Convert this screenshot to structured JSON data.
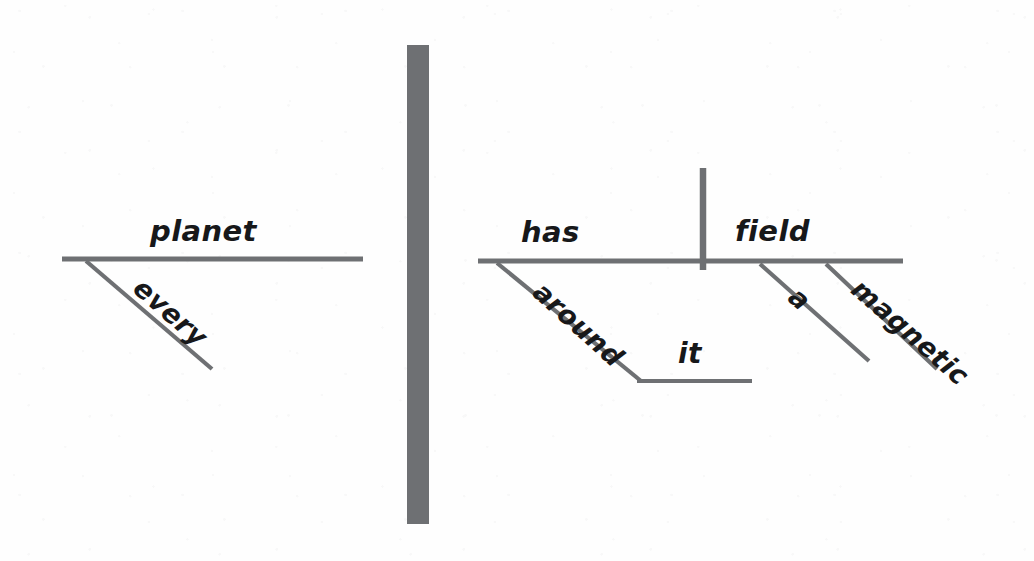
{
  "diagram": {
    "kind": "reed-kellogg-sentence-diagram",
    "sentence": "Every planet has a magnetic field around it.",
    "ink_color": "#6e7073",
    "text_color": "#17181a",
    "background_color": "#fefefe",
    "canvas": {
      "width": 1034,
      "height": 561
    },
    "words": {
      "subject": "planet",
      "subject_modifier": "every",
      "verb": "has",
      "direct_object": "field",
      "object_article": "a",
      "object_adjective": "magnetic",
      "preposition": "around",
      "preposition_object": "it"
    },
    "labels": [
      {
        "id": "planet",
        "text": "planet",
        "x": 150,
        "y": 214,
        "size": 29,
        "rotate": 0,
        "role": "subject"
      },
      {
        "id": "every",
        "text": "every",
        "x": 148,
        "y": 272,
        "size": 27,
        "rotate": 41,
        "role": "subject-modifier"
      },
      {
        "id": "has",
        "text": "has",
        "x": 521,
        "y": 215,
        "size": 29,
        "rotate": 0,
        "role": "verb"
      },
      {
        "id": "around",
        "text": "around",
        "x": 548,
        "y": 276,
        "size": 27,
        "rotate": 42,
        "role": "preposition"
      },
      {
        "id": "it",
        "text": "it",
        "x": 678,
        "y": 337,
        "size": 28,
        "rotate": 0,
        "role": "preposition-object"
      },
      {
        "id": "field",
        "text": "field",
        "x": 735,
        "y": 214,
        "size": 29,
        "rotate": 0,
        "role": "direct-object"
      },
      {
        "id": "a",
        "text": "a",
        "x": 803,
        "y": 281,
        "size": 27,
        "rotate": 41,
        "role": "object-article"
      },
      {
        "id": "magnetic",
        "text": "magnetic",
        "x": 866,
        "y": 273,
        "size": 27,
        "rotate": 41,
        "role": "object-adjective"
      }
    ],
    "strokes": [
      {
        "id": "left-baseline",
        "type": "line",
        "x1": 62,
        "y1": 259,
        "x2": 363,
        "y2": 259,
        "width": 5.2
      },
      {
        "id": "every-modifier-line",
        "type": "line",
        "x1": 86,
        "y1": 261,
        "x2": 212,
        "y2": 369,
        "width": 4.2
      },
      {
        "id": "center-divider-bar",
        "type": "rect",
        "x": 407,
        "y": 45,
        "w": 22,
        "h": 479
      },
      {
        "id": "right-baseline",
        "type": "line",
        "x1": 478,
        "y1": 261,
        "x2": 903,
        "y2": 261,
        "width": 5.2
      },
      {
        "id": "verb-object-divider",
        "type": "line",
        "x1": 703,
        "y1": 168,
        "x2": 703,
        "y2": 270,
        "width": 6.5
      },
      {
        "id": "around-prep-line",
        "type": "line",
        "x1": 497,
        "y1": 263,
        "x2": 641,
        "y2": 381,
        "width": 4.2
      },
      {
        "id": "it-object-line",
        "type": "line",
        "x1": 637,
        "y1": 381,
        "x2": 752,
        "y2": 381,
        "width": 4.2
      },
      {
        "id": "a-article-line",
        "type": "line",
        "x1": 760,
        "y1": 264,
        "x2": 869,
        "y2": 361,
        "width": 4.2
      },
      {
        "id": "magnetic-adj-line",
        "type": "line",
        "x1": 826,
        "y1": 264,
        "x2": 937,
        "y2": 369,
        "width": 4.2
      }
    ]
  }
}
